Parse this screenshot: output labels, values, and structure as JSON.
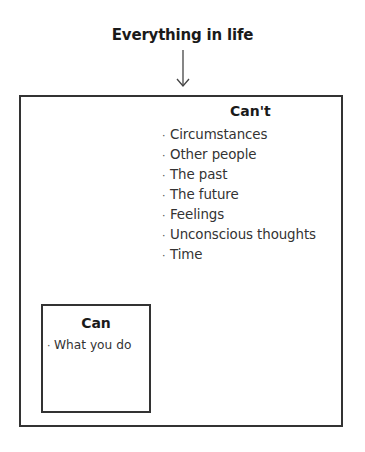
{
  "diagram": {
    "title": "Everything in life",
    "colors": {
      "border": "#333333",
      "text": "#333333",
      "heading": "#1a1a1a"
    },
    "cant": {
      "heading": "Can't",
      "bullet": "·",
      "items": [
        "Circumstances",
        "Other people",
        "The past",
        "The future",
        "Feelings",
        "Unconscious thoughts",
        "Time"
      ]
    },
    "can": {
      "heading": "Can",
      "bullet": "·",
      "items": [
        "What you do"
      ]
    }
  }
}
